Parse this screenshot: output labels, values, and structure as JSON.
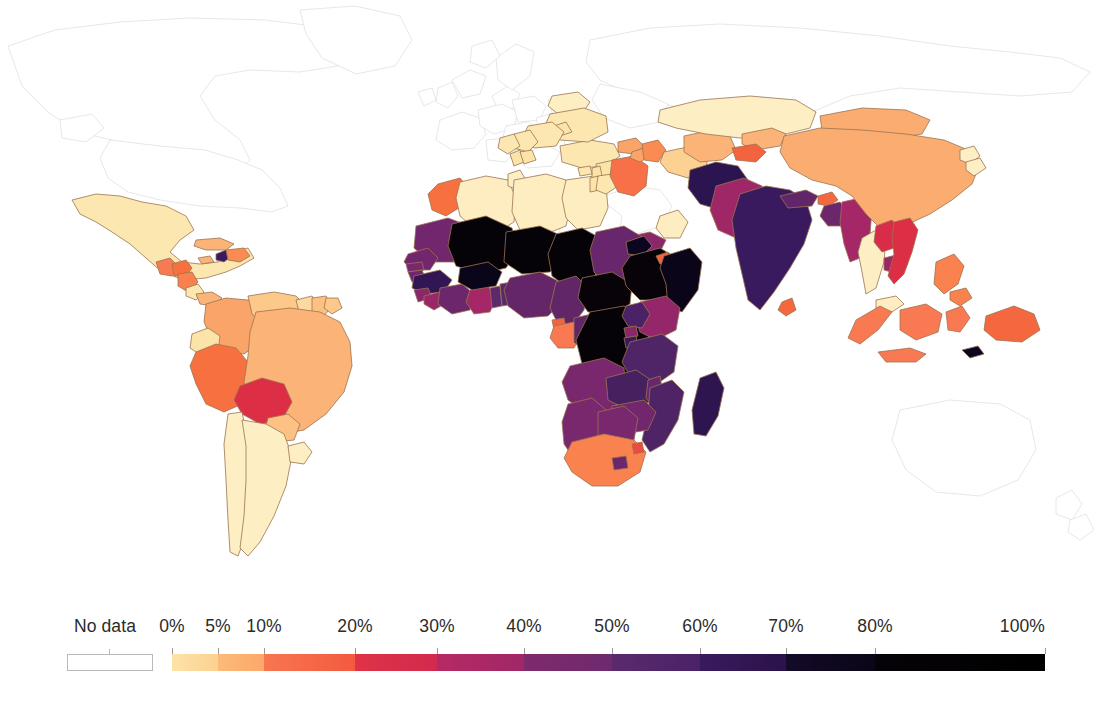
{
  "figure": {
    "type": "choropleth-world-map",
    "background_color": "#ffffff",
    "border_color": "#8a6a4a",
    "nodata_fill": "#ffffff",
    "nodata_border": "#d8d8d8"
  },
  "legend": {
    "nodata_label": "No data",
    "nodata_swatch_color": "#ffffff",
    "ticks": [
      {
        "label": "0%",
        "value": 0,
        "x": 172
      },
      {
        "label": "5%",
        "value": 5,
        "x": 218
      },
      {
        "label": "10%",
        "value": 10,
        "x": 264
      },
      {
        "label": "20%",
        "value": 20,
        "x": 355
      },
      {
        "label": "30%",
        "value": 30,
        "x": 437
      },
      {
        "label": "40%",
        "value": 40,
        "x": 524
      },
      {
        "label": "50%",
        "value": 50,
        "x": 612
      },
      {
        "label": "60%",
        "value": 60,
        "x": 700
      },
      {
        "label": "70%",
        "value": 70,
        "x": 786
      },
      {
        "label": "80%",
        "value": 80,
        "x": 875
      },
      {
        "label": "100%",
        "value": 100,
        "x": 1045
      }
    ],
    "segments": [
      {
        "from": 0,
        "to": 5,
        "x0": 172,
        "x1": 218,
        "color_start": "#fde3a8",
        "color_end": "#fcd192"
      },
      {
        "from": 5,
        "to": 10,
        "x0": 218,
        "x1": 264,
        "color_start": "#fcba78",
        "color_end": "#fba96a"
      },
      {
        "from": 10,
        "to": 20,
        "x0": 264,
        "x1": 355,
        "color_start": "#f8764f",
        "color_end": "#f45a3f"
      },
      {
        "from": 20,
        "to": 30,
        "x0": 355,
        "x1": 437,
        "color_start": "#e03347",
        "color_end": "#d22a4e"
      },
      {
        "from": 30,
        "to": 40,
        "x0": 437,
        "x1": 524,
        "color_start": "#b62a63",
        "color_end": "#a02767"
      },
      {
        "from": 40,
        "to": 50,
        "x0": 524,
        "x1": 612,
        "color_start": "#7e2a6d",
        "color_end": "#6e2a6e"
      },
      {
        "from": 50,
        "to": 60,
        "x0": 612,
        "x1": 700,
        "color_start": "#5b2a6c",
        "color_end": "#4a2268"
      },
      {
        "from": 60,
        "to": 70,
        "x0": 700,
        "x1": 786,
        "color_start": "#3a1a5e",
        "color_end": "#2a124a"
      },
      {
        "from": 70,
        "to": 80,
        "x0": 786,
        "x1": 875,
        "color_start": "#140a2a",
        "color_end": "#0a0616"
      },
      {
        "from": 80,
        "to": 100,
        "x0": 875,
        "x1": 1045,
        "color_start": "#060308",
        "color_end": "#000000"
      }
    ]
  },
  "chart_data": {
    "type": "heatmap",
    "title": "",
    "subtitle": "",
    "xlabel": "",
    "ylabel": "",
    "legend_position": "bottom",
    "grid": false,
    "colorbar": {
      "label": "",
      "unit": "%",
      "range": [
        0,
        100
      ],
      "tick_values": [
        0,
        5,
        10,
        20,
        30,
        40,
        50,
        60,
        70,
        80,
        100
      ],
      "tick_labels": [
        "0%",
        "5%",
        "10%",
        "20%",
        "30%",
        "40%",
        "50%",
        "60%",
        "70%",
        "80%",
        "100%"
      ],
      "colormap": "inferno-like",
      "nodata_label": "No data"
    },
    "regions": [
      {
        "name": "Mexico",
        "value": 4,
        "color": "#fce7b0"
      },
      {
        "name": "Guatemala",
        "value": 15,
        "color": "#f97a52"
      },
      {
        "name": "Honduras",
        "value": 17,
        "color": "#f7703f"
      },
      {
        "name": "Nicaragua",
        "value": 14,
        "color": "#f9804f"
      },
      {
        "name": "Haiti",
        "value": 62,
        "color": "#3a1a5e"
      },
      {
        "name": "Dominican Republic",
        "value": 12,
        "color": "#fa8b52"
      },
      {
        "name": "Colombia",
        "value": 11,
        "color": "#fba469"
      },
      {
        "name": "Venezuela",
        "value": 6,
        "color": "#fcc98a"
      },
      {
        "name": "Ecuador",
        "value": 4,
        "color": "#fce3a8"
      },
      {
        "name": "Peru",
        "value": 14,
        "color": "#f7703f"
      },
      {
        "name": "Bolivia",
        "value": 22,
        "color": "#dc2f45"
      },
      {
        "name": "Brazil",
        "value": 8,
        "color": "#fbb377"
      },
      {
        "name": "Guyana",
        "value": 5,
        "color": "#fcd9a0"
      },
      {
        "name": "Suriname",
        "value": 6,
        "color": "#fcc183"
      },
      {
        "name": "Paraguay",
        "value": 6,
        "color": "#fcc183"
      },
      {
        "name": "Chile",
        "value": 2,
        "color": "#fdeec4"
      },
      {
        "name": "Argentina",
        "value": 2,
        "color": "#fdeec4"
      },
      {
        "name": "Uruguay",
        "value": 2,
        "color": "#fdeec4"
      },
      {
        "name": "Morocco",
        "value": 14,
        "color": "#f7703f"
      },
      {
        "name": "Algeria",
        "value": 1,
        "color": "#fdedc0"
      },
      {
        "name": "Tunisia",
        "value": 2,
        "color": "#fdeec4"
      },
      {
        "name": "Libya",
        "value": 1,
        "color": "#fdedc0"
      },
      {
        "name": "Egypt",
        "value": 1,
        "color": "#fdedc0"
      },
      {
        "name": "Mauritania",
        "value": 42,
        "color": "#71266d"
      },
      {
        "name": "Western Sahara",
        "value": null,
        "color": "#ffffff"
      },
      {
        "name": "Mali",
        "value": 85,
        "color": "#060308"
      },
      {
        "name": "Niger",
        "value": 88,
        "color": "#050208"
      },
      {
        "name": "Chad",
        "value": 86,
        "color": "#060308"
      },
      {
        "name": "Sudan",
        "value": 45,
        "color": "#68266c"
      },
      {
        "name": "Senegal",
        "value": 42,
        "color": "#71266d"
      },
      {
        "name": "Gambia",
        "value": 40,
        "color": "#7a286d"
      },
      {
        "name": "Guinea-Bissau",
        "value": 43,
        "color": "#6e266c"
      },
      {
        "name": "Guinea",
        "value": 64,
        "color": "#321653"
      },
      {
        "name": "Sierra Leone",
        "value": 38,
        "color": "#8a276b"
      },
      {
        "name": "Liberia",
        "value": 35,
        "color": "#9a2768"
      },
      {
        "name": "Cote d'Ivoire",
        "value": 44,
        "color": "#6b266c"
      },
      {
        "name": "Ghana",
        "value": 33,
        "color": "#a62767"
      },
      {
        "name": "Togo",
        "value": 50,
        "color": "#5c2a6c"
      },
      {
        "name": "Benin",
        "value": 52,
        "color": "#572a6b"
      },
      {
        "name": "Burkina Faso",
        "value": 82,
        "color": "#0a0518"
      },
      {
        "name": "Nigeria",
        "value": 47,
        "color": "#642668"
      },
      {
        "name": "Cameroon",
        "value": 48,
        "color": "#612668"
      },
      {
        "name": "Central African Rep.",
        "value": 84,
        "color": "#070309"
      },
      {
        "name": "Equatorial Guinea",
        "value": 18,
        "color": "#f2643f"
      },
      {
        "name": "Gabon",
        "value": 15,
        "color": "#f97a52"
      },
      {
        "name": "Congo",
        "value": 48,
        "color": "#612668"
      },
      {
        "name": "DR Congo",
        "value": 88,
        "color": "#050208"
      },
      {
        "name": "Angola",
        "value": 40,
        "color": "#7a286d"
      },
      {
        "name": "Zambia",
        "value": 58,
        "color": "#46205f"
      },
      {
        "name": "Ethiopia",
        "value": 84,
        "color": "#070309"
      },
      {
        "name": "Eritrea",
        "value": 80,
        "color": "#0c0620"
      },
      {
        "name": "Djibouti",
        "value": 18,
        "color": "#f2643f"
      },
      {
        "name": "Somalia",
        "value": 82,
        "color": "#0a0518"
      },
      {
        "name": "Kenya",
        "value": 36,
        "color": "#94276a"
      },
      {
        "name": "Uganda",
        "value": 57,
        "color": "#4a2265"
      },
      {
        "name": "Rwanda",
        "value": 38,
        "color": "#8a276b"
      },
      {
        "name": "Burundi",
        "value": 62,
        "color": "#3a1a5e"
      },
      {
        "name": "Tanzania",
        "value": 55,
        "color": "#502568"
      },
      {
        "name": "Malawi",
        "value": 45,
        "color": "#68266c"
      },
      {
        "name": "Mozambique",
        "value": 56,
        "color": "#4e2467"
      },
      {
        "name": "Zimbabwe",
        "value": 42,
        "color": "#71266d"
      },
      {
        "name": "Madagascar",
        "value": 65,
        "color": "#2f1550"
      },
      {
        "name": "Namibia",
        "value": 40,
        "color": "#7a286d"
      },
      {
        "name": "Botswana",
        "value": 40,
        "color": "#7a286d"
      },
      {
        "name": "South Africa",
        "value": 14,
        "color": "#f9824f"
      },
      {
        "name": "Lesotho",
        "value": 44,
        "color": "#6b266c"
      },
      {
        "name": "Eswatini",
        "value": 20,
        "color": "#ea4b42"
      },
      {
        "name": "Yemen",
        "value": 38,
        "color": "#8a276b"
      },
      {
        "name": "Iraq",
        "value": 16,
        "color": "#f87048"
      },
      {
        "name": "Syria",
        "value": 4,
        "color": "#fce3a8"
      },
      {
        "name": "Jordan",
        "value": 3,
        "color": "#fde7b0"
      },
      {
        "name": "Turkey",
        "value": 3,
        "color": "#fde7b0"
      },
      {
        "name": "Azerbaijan",
        "value": 12,
        "color": "#fa8b52"
      },
      {
        "name": "Georgia",
        "value": 10,
        "color": "#fba469"
      },
      {
        "name": "Armenia",
        "value": 11,
        "color": "#fba469"
      },
      {
        "name": "Turkmenistan",
        "value": 5,
        "color": "#fcd192"
      },
      {
        "name": "Uzbekistan",
        "value": 9,
        "color": "#fbb377"
      },
      {
        "name": "Kazakhstan",
        "value": 2,
        "color": "#fdeec4"
      },
      {
        "name": "Kyrgyzstan",
        "value": 8,
        "color": "#fbb377"
      },
      {
        "name": "Tajikistan",
        "value": 18,
        "color": "#f2643f"
      },
      {
        "name": "Afghanistan",
        "value": 66,
        "color": "#2c1450"
      },
      {
        "name": "Pakistan",
        "value": 34,
        "color": "#9f2767"
      },
      {
        "name": "India",
        "value": 62,
        "color": "#3a1a5e"
      },
      {
        "name": "Nepal",
        "value": 48,
        "color": "#612668"
      },
      {
        "name": "Bhutan",
        "value": 17,
        "color": "#f5683f"
      },
      {
        "name": "Bangladesh",
        "value": 44,
        "color": "#6b266c"
      },
      {
        "name": "Myanmar",
        "value": 33,
        "color": "#a62767"
      },
      {
        "name": "China",
        "value": 8,
        "color": "#fbad71"
      },
      {
        "name": "Mongolia",
        "value": 8,
        "color": "#fbad71"
      },
      {
        "name": "Thailand",
        "value": 2,
        "color": "#fdeec4"
      },
      {
        "name": "Laos",
        "value": 23,
        "color": "#d82c49"
      },
      {
        "name": "Cambodia",
        "value": 35,
        "color": "#9a2768"
      },
      {
        "name": "Vietnam",
        "value": 22,
        "color": "#dc2f45"
      },
      {
        "name": "Malaysia",
        "value": 1,
        "color": "#fdedc0"
      },
      {
        "name": "Indonesia",
        "value": 15,
        "color": "#f97a52"
      },
      {
        "name": "Philippines",
        "value": 14,
        "color": "#f9824f"
      },
      {
        "name": "Papua New Guinea",
        "value": 17,
        "color": "#f5683f"
      },
      {
        "name": "Timor-Leste",
        "value": 80,
        "color": "#0c0620"
      },
      {
        "name": "Belarus",
        "value": 2,
        "color": "#fdeec4"
      },
      {
        "name": "Ukraine",
        "value": 3,
        "color": "#fde7b0"
      },
      {
        "name": "Moldova",
        "value": 4,
        "color": "#fce3a8"
      },
      {
        "name": "Romania",
        "value": 3,
        "color": "#fde7b0"
      },
      {
        "name": "Serbia",
        "value": 3,
        "color": "#fde7b0"
      },
      {
        "name": "Bosnia and Herzegovina",
        "value": 3,
        "color": "#fde7b0"
      },
      {
        "name": "Albania",
        "value": 4,
        "color": "#fce3a8"
      },
      {
        "name": "North Macedonia",
        "value": 4,
        "color": "#fce3a8"
      },
      {
        "name": "United States",
        "value": null,
        "color": "#ffffff"
      },
      {
        "name": "Canada",
        "value": null,
        "color": "#ffffff"
      },
      {
        "name": "Russia",
        "value": null,
        "color": "#ffffff"
      },
      {
        "name": "Australia",
        "value": null,
        "color": "#ffffff"
      },
      {
        "name": "Saudi Arabia",
        "value": null,
        "color": "#ffffff"
      },
      {
        "name": "Iran",
        "value": null,
        "color": "#ffffff"
      },
      {
        "name": "Greenland",
        "value": null,
        "color": "#ffffff"
      }
    ]
  }
}
